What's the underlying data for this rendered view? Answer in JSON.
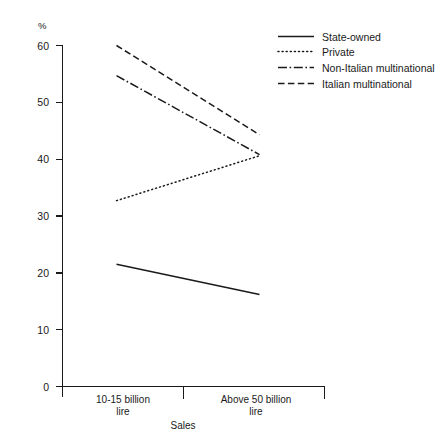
{
  "chart_data": {
    "type": "line",
    "title": "",
    "xlabel": "Sales",
    "ylabel": "%",
    "ylim": [
      0,
      60
    ],
    "yticks": [
      0,
      10,
      20,
      30,
      40,
      50,
      60
    ],
    "ytick_labels": [
      "0",
      "10",
      "20",
      "30",
      "40",
      "50",
      "60"
    ],
    "grid": false,
    "legend_position": "top-right",
    "categories": [
      "10-15 billion lire",
      "Above 50 billion lire"
    ],
    "category_lines": [
      [
        "10-15 billion",
        "lire"
      ],
      [
        "Above 50 billion",
        "lire"
      ]
    ],
    "series": [
      {
        "name": "State-owned",
        "style": "solid",
        "values": [
          21.5,
          16.2
        ]
      },
      {
        "name": "Private",
        "style": "dotted",
        "values": [
          32.7,
          40.6
        ]
      },
      {
        "name": "Non-Italian multinational",
        "style": "dash-dot",
        "values": [
          54.7,
          40.8
        ]
      },
      {
        "name": "Italian multinational",
        "style": "dashed",
        "values": [
          60.0,
          44.3
        ]
      }
    ]
  },
  "axes": {
    "y_unit_label": "%",
    "x_axis_title": "Sales",
    "y_tick_0": "0",
    "y_tick_10": "10",
    "y_tick_20": "20",
    "y_tick_30": "30",
    "y_tick_40": "40",
    "y_tick_50": "50",
    "y_tick_60": "60",
    "cat_1_line_1": "10-15 billion",
    "cat_1_line_2": "lire",
    "cat_2_line_1": "Above 50 billion",
    "cat_2_line_2": "lire"
  },
  "legend": {
    "items": [
      {
        "label": "State-owned",
        "style": "solid"
      },
      {
        "label": "Private",
        "style": "dotted"
      },
      {
        "label": "Non-Italian multinational",
        "style": "dash-dot"
      },
      {
        "label": "Italian multinational",
        "style": "dashed"
      }
    ]
  },
  "colors": {
    "ink": "#1a1a1a",
    "background": "#ffffff"
  }
}
